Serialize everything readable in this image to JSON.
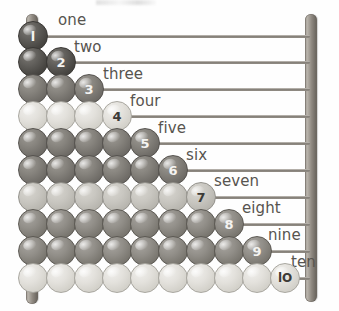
{
  "image": {
    "title": "Counting abacus with ten rows of beads",
    "frame_color": "#8e8880",
    "rod_color": "#8d8881",
    "background": "#ffffff"
  },
  "frame": {
    "left_post_name": "left-post",
    "right_post_name": "right-post"
  },
  "rows": [
    {
      "number": 1,
      "numeral": "l",
      "word": "one",
      "beads": 1,
      "tone": "tone-dark",
      "num_class": "num-on-dark",
      "word_x": 58,
      "word_y": 11,
      "y": 21
    },
    {
      "number": 2,
      "numeral": "2",
      "word": "two",
      "beads": 2,
      "tone": "tone-dark",
      "num_class": "num-on-dark",
      "word_x": 74,
      "word_y": 38,
      "y": 47
    },
    {
      "number": 3,
      "numeral": "3",
      "word": "three",
      "beads": 3,
      "tone": "tone-mid",
      "num_class": "num-on-dark",
      "word_x": 103,
      "word_y": 65,
      "y": 74
    },
    {
      "number": 4,
      "numeral": "4",
      "word": "four",
      "beads": 4,
      "tone": "tone-light",
      "num_class": "num-on-light",
      "word_x": 130,
      "word_y": 92,
      "y": 101
    },
    {
      "number": 5,
      "numeral": "5",
      "word": "five",
      "beads": 5,
      "tone": "tone-mid",
      "num_class": "num-on-dark",
      "word_x": 158,
      "word_y": 119,
      "y": 128
    },
    {
      "number": 6,
      "numeral": "6",
      "word": "six",
      "beads": 6,
      "tone": "tone-mid",
      "num_class": "num-on-dark",
      "word_x": 186,
      "word_y": 146,
      "y": 155
    },
    {
      "number": 7,
      "numeral": "7",
      "word": "seven",
      "beads": 7,
      "tone": "tone-pale",
      "num_class": "num-on-light",
      "word_x": 214,
      "word_y": 172,
      "y": 182
    },
    {
      "number": 8,
      "numeral": "8",
      "word": "eight",
      "beads": 8,
      "tone": "tone-mid2",
      "num_class": "num-on-dark",
      "word_x": 242,
      "word_y": 199,
      "y": 209
    },
    {
      "number": 9,
      "numeral": "9",
      "word": "nine",
      "beads": 9,
      "tone": "tone-mid2",
      "num_class": "num-on-dark",
      "word_x": 268,
      "word_y": 226,
      "y": 236
    },
    {
      "number": 10,
      "numeral": "lO",
      "word": "ten",
      "beads": 10,
      "tone": "tone-light",
      "num_class": "num-on-light",
      "word_x": 291,
      "word_y": 253,
      "y": 263
    }
  ],
  "layout": {
    "bead_start_x": 18,
    "bead_step": 28,
    "bead_size": 30,
    "rod_left": 30,
    "rod_width": 280
  }
}
